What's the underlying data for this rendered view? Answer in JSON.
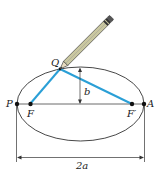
{
  "figure": {
    "colors": {
      "ellipse": "#333333",
      "string": "#2a9fd6",
      "axis": "#333333",
      "pencil_body": "#c9c7a0",
      "pencil_outline": "#333333"
    },
    "points": {
      "P": {
        "label": "P"
      },
      "A": {
        "label": "A"
      },
      "F": {
        "label": "F"
      },
      "F_prime": {
        "label": "F′"
      },
      "Q": {
        "label": "Q"
      }
    },
    "dimensions": {
      "semi_minor": {
        "label": "b"
      },
      "major_axis": {
        "label": "2a"
      }
    }
  }
}
